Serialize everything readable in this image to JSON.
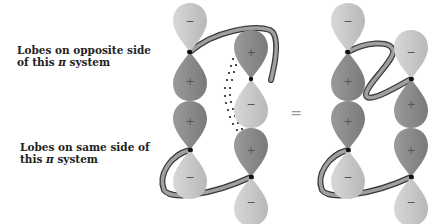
{
  "labels": {
    "opposite": {
      "line1": "Lobes on opposite side",
      "line2_prefix": "of this ",
      "line2_pi": "π",
      "line2_suffix": " system"
    },
    "same": {
      "line1": "Lobes on same side of",
      "line2_prefix": "this ",
      "line2_pi": "π",
      "line2_suffix": " system"
    }
  },
  "equals_sign": "=",
  "signs": {
    "plus": "+",
    "minus": "−"
  },
  "colors": {
    "plus_lobe": "#8a8a8a",
    "minus_lobe": "#c8c8c8",
    "node": "#111111",
    "ribbon_fill": "#a0a0a0",
    "ribbon_edge": "#3a3a3a",
    "dots": "#222222",
    "text": "#222222"
  },
  "diagrams": [
    {
      "name": "left-diagram",
      "orbitals": [
        {
          "id": "p1",
          "x": 190,
          "node_y": 52,
          "top": "minus",
          "bottom": "plus"
        },
        {
          "id": "p2",
          "x": 251,
          "node_y": 79,
          "top": "plus",
          "bottom": "minus"
        },
        {
          "id": "p3",
          "x": 190,
          "node_y": 150,
          "top": "plus",
          "bottom": "minus"
        },
        {
          "id": "p4",
          "x": 251,
          "node_y": 177,
          "top": "plus",
          "bottom": "minus"
        }
      ]
    },
    {
      "name": "right-diagram",
      "orbitals": [
        {
          "id": "p1",
          "x": 348,
          "node_y": 52,
          "top": "minus",
          "bottom": "plus"
        },
        {
          "id": "p2",
          "x": 411,
          "node_y": 79,
          "top": "minus",
          "bottom": "plus"
        },
        {
          "id": "p3",
          "x": 348,
          "node_y": 150,
          "top": "plus",
          "bottom": "minus"
        },
        {
          "id": "p4",
          "x": 411,
          "node_y": 177,
          "top": "plus",
          "bottom": "minus"
        }
      ]
    }
  ]
}
